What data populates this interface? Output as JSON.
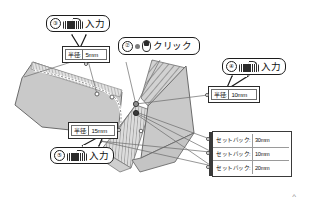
{
  "scene": {
    "title": "CAD polygon editing with callout annotations"
  },
  "callouts": [
    {
      "number": "②",
      "icon": "mouse-icon",
      "action": "クリック"
    },
    {
      "number": "③",
      "icon": "keyboard-icon",
      "action": "入力"
    },
    {
      "number": "④",
      "icon": "keyboard-icon",
      "action": "入力"
    },
    {
      "number": "⑤",
      "icon": "keyboard-icon",
      "action": "入力"
    }
  ],
  "fields": [
    {
      "label": "半径:",
      "value": "5mm"
    },
    {
      "label": "半径:",
      "value": "10mm"
    },
    {
      "label": "半径:",
      "value": "15mm"
    }
  ],
  "setback_table": {
    "rows": [
      {
        "label": "セットバック:",
        "value": "30mm"
      },
      {
        "label": "セットバック:",
        "value": "10mm"
      },
      {
        "label": "セットバック:",
        "value": "20mm"
      }
    ]
  },
  "marks": {
    "scroll_caret": "^"
  },
  "colors": {
    "shape_fill": "#c9c9c9",
    "shape_stroke": "#6b6b6b",
    "hatch": "#8f8f8f",
    "outline": "#1c1c1c",
    "background": "#ffffff"
  }
}
